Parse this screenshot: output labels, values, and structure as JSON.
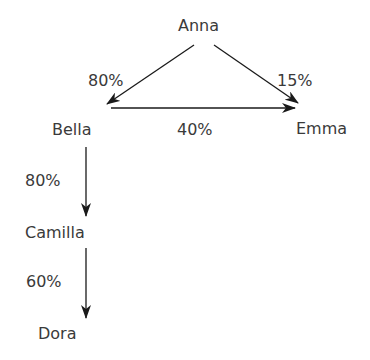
{
  "diagram": {
    "nodes": {
      "anna": "Anna",
      "bella": "Bella",
      "emma": "Emma",
      "camilla": "Camilla",
      "dora": "Dora"
    },
    "edges": [
      {
        "from": "Anna",
        "to": "Bella",
        "label": "80%"
      },
      {
        "from": "Anna",
        "to": "Emma",
        "label": "15%"
      },
      {
        "from": "Bella",
        "to": "Emma",
        "label": "40%"
      },
      {
        "from": "Bella",
        "to": "Camilla",
        "label": "80%"
      },
      {
        "from": "Camilla",
        "to": "Dora",
        "label": "60%"
      }
    ],
    "colors": {
      "text": "#3a3a3a",
      "arrow": "#1a1a1a",
      "background": "#ffffff"
    }
  }
}
